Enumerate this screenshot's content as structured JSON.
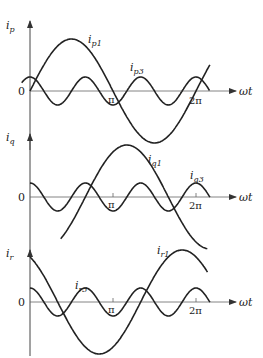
{
  "figure": {
    "panels": [
      {
        "id": "p",
        "y_label_base": "i",
        "y_label_sub": "p",
        "x_label": "ωt",
        "zero_label": "0",
        "tick_pi": "π",
        "tick_2pi": "2π",
        "fund_label_base": "i",
        "fund_label_sub": "p1",
        "harm_label_base": "i",
        "harm_label_sub": "p3"
      },
      {
        "id": "q",
        "y_label_base": "i",
        "y_label_sub": "q",
        "x_label": "ωt",
        "zero_label": "0",
        "tick_pi": "π",
        "tick_2pi": "2π",
        "fund_label_base": "i",
        "fund_label_sub": "q1",
        "harm_label_base": "i",
        "harm_label_sub": "q3"
      },
      {
        "id": "r",
        "y_label_base": "i",
        "y_label_sub": "r",
        "x_label": "ωt",
        "zero_label": "0",
        "tick_pi": "π",
        "tick_2pi": "2π",
        "fund_label_base": "i",
        "fund_label_sub": "r1",
        "harm_label_base": "i",
        "harm_label_sub": "r3"
      }
    ],
    "line_color": "#222222",
    "axis_color": "#555555"
  },
  "chart_data": {
    "type": "line",
    "title": "",
    "xlabel": "ωt",
    "x_ticks": [
      "0",
      "π",
      "2π"
    ],
    "panels": [
      {
        "ylabel": "i_p",
        "series": [
          {
            "name": "i_p1",
            "expr": "A1·sin(ωt)",
            "amplitude": 1.0,
            "phase_deg": 0
          },
          {
            "name": "i_p3",
            "expr": "A3·cos(3ωt)",
            "amplitude": 0.27,
            "harmonic": 3
          }
        ]
      },
      {
        "ylabel": "i_q",
        "series": [
          {
            "name": "i_q1",
            "expr": "A1·sin(ωt − 120°)",
            "amplitude": 1.0,
            "phase_deg": -120
          },
          {
            "name": "i_q3",
            "expr": "A3·cos(3ωt)",
            "amplitude": 0.27,
            "harmonic": 3
          }
        ]
      },
      {
        "ylabel": "i_r",
        "series": [
          {
            "name": "i_r1",
            "expr": "A1·sin(ωt + 120°)",
            "amplitude": 1.0,
            "phase_deg": 120
          },
          {
            "name": "i_r3",
            "expr": "A3·cos(3ωt)",
            "amplitude": 0.27,
            "harmonic": 3
          }
        ]
      }
    ]
  }
}
